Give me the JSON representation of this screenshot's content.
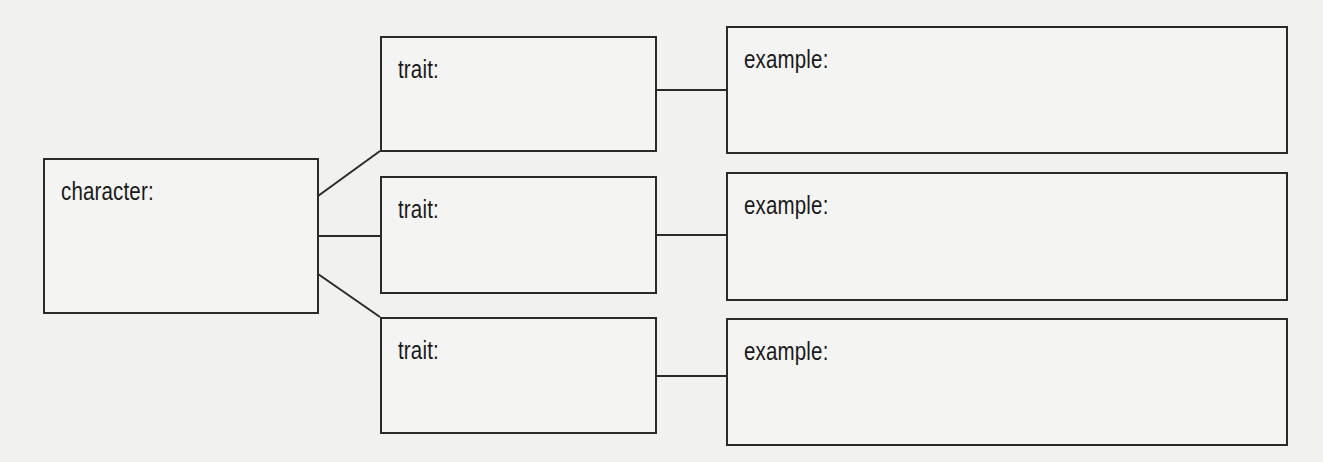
{
  "diagram": {
    "type": "character-trait-example organizer",
    "character": {
      "label": "character:"
    },
    "traits": [
      {
        "label": "trait:",
        "example": {
          "label": "example:"
        }
      },
      {
        "label": "trait:",
        "example": {
          "label": "example:"
        }
      },
      {
        "label": "trait:",
        "example": {
          "label": "example:"
        }
      }
    ],
    "colors": {
      "stroke": "#2a2a2a",
      "background": "#f1f1ef",
      "text": "#1a1a1a"
    }
  }
}
